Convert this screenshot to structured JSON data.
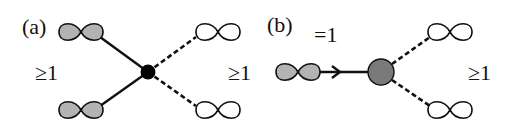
{
  "panels": {
    "a": {
      "label": "(a)",
      "left_count": "≥1",
      "right_count": "≥1",
      "center_node": "filled-black-vertex",
      "left_orbitals": [
        "shaded-orbital",
        "shaded-orbital"
      ],
      "right_orbitals": [
        "open-orbital",
        "open-orbital"
      ],
      "left_edges": "solid",
      "right_edges": "dashed"
    },
    "b": {
      "label": "(b)",
      "top_count": "=1",
      "right_count": "≥1",
      "center_node": "gray-vertex",
      "left_orbitals": [
        "shaded-orbital"
      ],
      "right_orbitals": [
        "open-orbital",
        "open-orbital"
      ],
      "left_edges": "solid-arrow",
      "right_edges": "dashed"
    }
  },
  "colors": {
    "shaded_fill": "#b3b3b3",
    "gray_node": "#7a7a7a",
    "black_node": "#000000",
    "stroke": "#111111"
  }
}
